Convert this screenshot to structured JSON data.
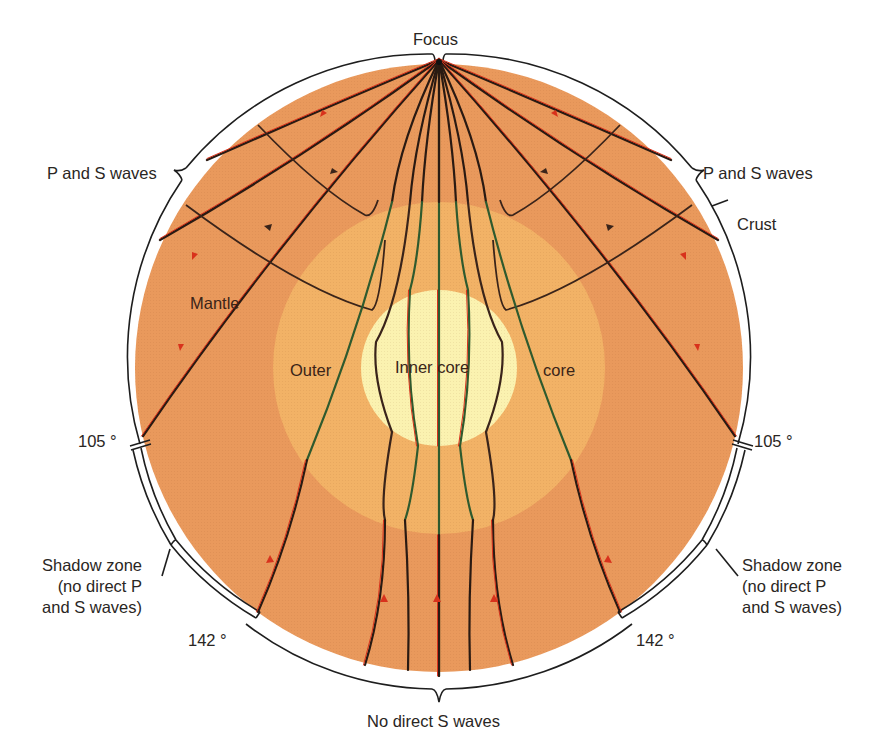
{
  "figure": {
    "colors": {
      "mantle": "#e9995c",
      "outer_core": "#f2b266",
      "inner_core": "#fbf2b0",
      "p_wave": "#d8321c",
      "s_wave": "#2a1a12",
      "core_p_wave": "#2f5a2e",
      "reflected_wave": "#3a241a",
      "outline": "#1e1e1e"
    },
    "geometry": {
      "center": [
        439,
        368
      ],
      "mantle_radius": 304,
      "bracket_radius": 313,
      "outer_core_radius": 166,
      "inner_core_radius": 78
    }
  },
  "labels": {
    "focus": "Focus",
    "p_and_s_left": "P and S waves",
    "p_and_s_right": "P and S waves",
    "crust": "Crust",
    "mantle": "Mantle",
    "outer": "Outer",
    "inner_core": "Inner core",
    "core": "core",
    "deg_105_left": "105 °",
    "deg_105_right": "105 °",
    "shadow_left": "Shadow zone\n(no direct P\nand S waves)",
    "shadow_right": "Shadow zone\n(no direct P\nand S waves)",
    "deg_142_left": "142 °",
    "deg_142_right": "142 °",
    "no_direct_s": "No direct S waves"
  }
}
